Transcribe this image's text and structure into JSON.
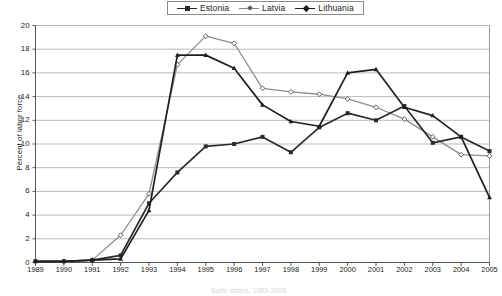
{
  "chart_data": {
    "type": "line",
    "title": "",
    "caption": "Baltic states, 1989-2005",
    "xlabel": "",
    "ylabel": "Percent of labor force",
    "grid": true,
    "legend_position": "top-center",
    "xlim": [
      1989,
      2005
    ],
    "ylim": [
      0,
      20
    ],
    "ytick_step": 2,
    "categories": [
      "1989",
      "1990",
      "1991",
      "1992",
      "1993",
      "1994",
      "1995",
      "1996",
      "1997",
      "1998",
      "1999",
      "2000",
      "2001",
      "2002",
      "2003",
      "2004",
      "2005"
    ],
    "x": [
      1989,
      1990,
      1991,
      1992,
      1993,
      1994,
      1995,
      1996,
      1997,
      1998,
      1999,
      2000,
      2001,
      2002,
      2003,
      2004,
      2005
    ],
    "yticks": [
      "0",
      "2",
      "4",
      "6",
      "8",
      "10",
      "12",
      "14",
      "16",
      "18",
      "20"
    ],
    "series": [
      {
        "name": "Estonia",
        "marker": "square",
        "color": "#2b2b2b",
        "values": [
          0.1,
          0.1,
          0.2,
          0.6,
          5.0,
          7.6,
          9.8,
          10.0,
          10.6,
          9.3,
          11.4,
          12.6,
          12.0,
          13.2,
          10.1,
          10.6,
          9.4
        ]
      },
      {
        "name": "Latvia",
        "marker": "diamond",
        "color": "#8c8c8c",
        "values": [
          0.1,
          0.1,
          0.2,
          2.3,
          5.8,
          16.7,
          19.1,
          18.5,
          14.7,
          14.4,
          14.2,
          13.8,
          13.1,
          12.1,
          10.6,
          9.1,
          9.0
        ]
      },
      {
        "name": "Lithuania",
        "marker": "triangle",
        "color": "#1f1f1f",
        "values": [
          0.1,
          0.1,
          0.2,
          0.3,
          4.4,
          17.5,
          17.5,
          16.4,
          13.3,
          11.9,
          11.5,
          16.0,
          16.3,
          13.1,
          12.4,
          10.6,
          5.5
        ]
      }
    ]
  }
}
